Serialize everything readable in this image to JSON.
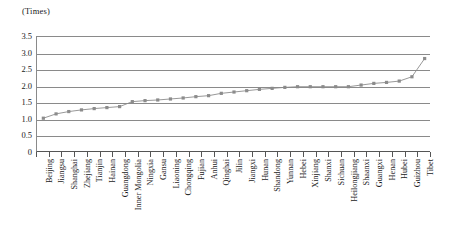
{
  "chart_data": {
    "type": "line",
    "title": "",
    "subtitle": "",
    "xlabel": "",
    "ylabel": "(Times)",
    "unit_label": "(Times)",
    "ylim": [
      0,
      3.5
    ],
    "ytick_labels": [
      "0",
      "0.5",
      "1.0",
      "1.5",
      "2.0",
      "2.5",
      "3.0",
      "3.5"
    ],
    "ytick_values": [
      0,
      0.5,
      1.0,
      1.5,
      2.0,
      2.5,
      3.0,
      3.5
    ],
    "grid": true,
    "grid_axis": "y",
    "legend": false,
    "legend_position": "none",
    "marker": "square",
    "series_color": "#8c8c8c",
    "categories": [
      "Beijing",
      "Jiangsu",
      "Shanghai",
      "Zhejiang",
      "Tianjin",
      "Hainan",
      "Guangdong",
      "Inner Mongolia",
      "Ningxia",
      "Gansu",
      "Liaoning",
      "Chongqing",
      "Fujian",
      "Anhui",
      "Qinghai",
      "Jilin",
      "Jiangxi",
      "Hunan",
      "Shandong",
      "Yunnan",
      "Hebei",
      "Xinjiang",
      "Shanxi",
      "Sichuan",
      "Heilongjiang",
      "Shaanxi",
      "Guangxi",
      "Henan",
      "Hubei",
      "Guizhou",
      "Tibet"
    ],
    "values": [
      1.05,
      1.18,
      1.25,
      1.3,
      1.34,
      1.37,
      1.4,
      1.55,
      1.58,
      1.6,
      1.63,
      1.66,
      1.7,
      1.73,
      1.8,
      1.84,
      1.88,
      1.92,
      1.95,
      1.98,
      2.0,
      2.0,
      2.0,
      2.0,
      2.0,
      2.05,
      2.1,
      2.13,
      2.17,
      2.3,
      2.85
    ]
  },
  "colors": {
    "axis": "#555555",
    "grid": "#8a8a8a",
    "series": "#8c8c8c",
    "text": "#1a1a1a",
    "background": "#ffffff"
  }
}
